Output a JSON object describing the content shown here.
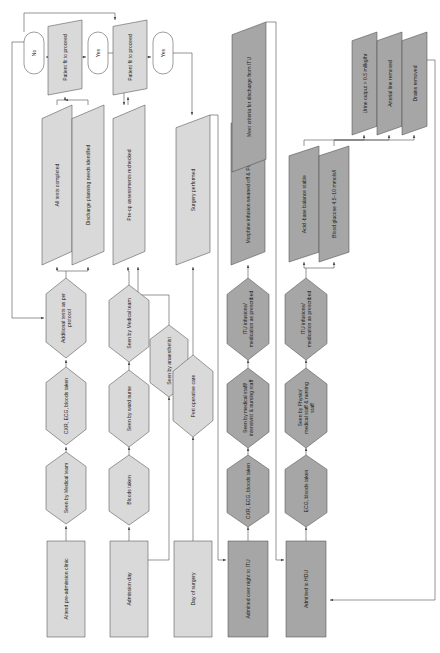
{
  "diagram": {
    "orientation": "rotated-90-ccw",
    "colors": {
      "fill_light": "#d9d9d9",
      "fill_dark": "#a6a6a6",
      "stroke": "#4d4d4d",
      "background": "#ffffff",
      "text": "#1a1a1a"
    },
    "lanes": [
      {
        "id": "lane1",
        "start_label": "Attend pre-admission clinic"
      },
      {
        "id": "lane2",
        "start_label": "Admission day"
      },
      {
        "id": "lane3",
        "start_label": "Day of surgery"
      },
      {
        "id": "lane4",
        "start_label": "Admitted over night to ITU"
      },
      {
        "id": "lane5",
        "start_label": "Admitted to HDU"
      }
    ],
    "nodes": [
      {
        "id": "n01",
        "label": "Attend pre-admission clinic",
        "shape": "rect",
        "tone": "light"
      },
      {
        "id": "n02",
        "label": "Seen by Medical team",
        "shape": "hexagon",
        "tone": "light"
      },
      {
        "id": "n03",
        "label": "CXR, ECG, bloods taken",
        "shape": "hexagon",
        "tone": "light"
      },
      {
        "id": "n04",
        "label": "Additional tests as per protocol",
        "shape": "hexagon",
        "tone": "light"
      },
      {
        "id": "n05",
        "label": "All tests completed",
        "shape": "parallelogram",
        "tone": "light"
      },
      {
        "id": "n06",
        "label": "Discharge planning needs identified",
        "shape": "parallelogram",
        "tone": "light"
      },
      {
        "id": "n07",
        "label": "Patient fit to proceed",
        "shape": "parallelogram",
        "tone": "light"
      },
      {
        "id": "n08",
        "label": "No",
        "shape": "stadium",
        "tone": "white"
      },
      {
        "id": "n09",
        "label": "Yes",
        "shape": "stadium",
        "tone": "white"
      },
      {
        "id": "n10",
        "label": "Admission day",
        "shape": "rect",
        "tone": "light"
      },
      {
        "id": "n11",
        "label": "Bloods taken",
        "shape": "hexagon",
        "tone": "light"
      },
      {
        "id": "n12",
        "label": "Seen by ward nurse",
        "shape": "hexagon",
        "tone": "light"
      },
      {
        "id": "n13",
        "label": "Seen by Medical team",
        "shape": "hexagon",
        "tone": "light"
      },
      {
        "id": "n14",
        "label": "Seen by anaesthetist",
        "shape": "hexagon",
        "tone": "light"
      },
      {
        "id": "n15",
        "label": "Pre-op assessments rechecked",
        "shape": "parallelogram",
        "tone": "light"
      },
      {
        "id": "n16",
        "label": "Patient fit to proceed",
        "shape": "parallelogram",
        "tone": "light"
      },
      {
        "id": "n17",
        "label": "Yes",
        "shape": "stadium",
        "tone": "white"
      },
      {
        "id": "n18",
        "label": "Day of surgery",
        "shape": "rect",
        "tone": "light"
      },
      {
        "id": "n19",
        "label": "Peri operative care",
        "shape": "hexagon",
        "tone": "light"
      },
      {
        "id": "n20",
        "label": "Surgery performed",
        "shape": "parallelogram",
        "tone": "light"
      },
      {
        "id": "n21",
        "label": "Admitted over night to ITU",
        "shape": "rect",
        "tone": "dark"
      },
      {
        "id": "n22",
        "label": "CXR, ECG, bloods taken",
        "shape": "hexagon",
        "tone": "dark"
      },
      {
        "id": "n23",
        "label": "Seen by medical staff/ intensivist & nursing staff",
        "shape": "hexagon",
        "tone": "dark"
      },
      {
        "id": "n24",
        "label": "ITU infusions/ medication as prescribed",
        "shape": "hexagon",
        "tone": "dark"
      },
      {
        "id": "n25",
        "label": "Morphine infusion weaned off & PCA commenced",
        "shape": "parallelogram",
        "tone": "dark"
      },
      {
        "id": "n26",
        "label": "Meet criteria for discharge from ITU",
        "shape": "parallelogram",
        "tone": "dark"
      },
      {
        "id": "n27",
        "label": "Admitted to HDU",
        "shape": "rect",
        "tone": "dark"
      },
      {
        "id": "n28",
        "label": "ECG, bloods taken",
        "shape": "hexagon",
        "tone": "dark"
      },
      {
        "id": "n29",
        "label": "Seen by Physio/ medical staff & nursing staff",
        "shape": "hexagon",
        "tone": "dark"
      },
      {
        "id": "n30",
        "label": "ITU infusions/ medication as prescribed",
        "shape": "hexagon",
        "tone": "dark"
      },
      {
        "id": "n31",
        "label": "Acid -base balance stable",
        "shape": "parallelogram",
        "tone": "dark"
      },
      {
        "id": "n32",
        "label": "Blood glucose 4.5–10 mmols/l",
        "shape": "parallelogram",
        "tone": "dark"
      },
      {
        "id": "n33",
        "label": "Urine output > 0.5 ml/kg/hr",
        "shape": "parallelogram",
        "tone": "dark"
      },
      {
        "id": "n34",
        "label": "Arterial line removed",
        "shape": "parallelogram",
        "tone": "dark"
      },
      {
        "id": "n35",
        "label": "Drains removed",
        "shape": "parallelogram",
        "tone": "dark"
      }
    ]
  }
}
